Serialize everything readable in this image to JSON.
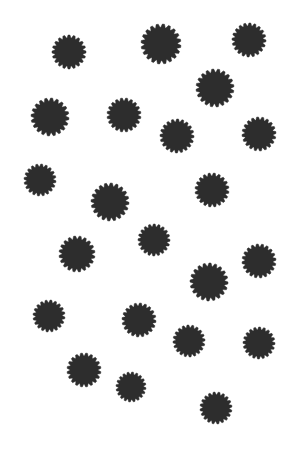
{
  "canvas": {
    "width": 304,
    "height": 473,
    "background_color": "#ffffff",
    "title": "Starburst Scatter"
  },
  "style": {
    "shape_fill_color": "#2d2d2d",
    "shape_kind": "starburst",
    "spike_count": 20,
    "inner_radius_ratio": 0.8,
    "spike_tip_rounding": 0.06
  },
  "chart_data": {
    "type": "scatter",
    "title": "",
    "subtitle": "",
    "xlabel": "",
    "ylabel": "",
    "grid": false,
    "legend": null,
    "axis_visible": false,
    "xlim": [
      0,
      304
    ],
    "ylim": [
      0,
      473
    ],
    "marker": "starburst",
    "marker_color": "#2d2d2d",
    "point_count": 22,
    "series": [
      {
        "name": "starbursts",
        "color": "#2d2d2d",
        "points": [
          {
            "id": "s1",
            "x": 69,
            "y": 52,
            "r": 17,
            "rotation": 0
          },
          {
            "id": "s2",
            "x": 161,
            "y": 44,
            "r": 20,
            "rotation": 7
          },
          {
            "id": "s3",
            "x": 249,
            "y": 40,
            "r": 17,
            "rotation": 3
          },
          {
            "id": "s4",
            "x": 215,
            "y": 88,
            "r": 19,
            "rotation": 11
          },
          {
            "id": "s5",
            "x": 50,
            "y": 117,
            "r": 19,
            "rotation": 5
          },
          {
            "id": "s6",
            "x": 124,
            "y": 115,
            "r": 17,
            "rotation": 9
          },
          {
            "id": "s7",
            "x": 177,
            "y": 136,
            "r": 17,
            "rotation": 2
          },
          {
            "id": "s8",
            "x": 259,
            "y": 134,
            "r": 17,
            "rotation": 13
          },
          {
            "id": "s9",
            "x": 40,
            "y": 180,
            "r": 16,
            "rotation": 6
          },
          {
            "id": "s10",
            "x": 110,
            "y": 202,
            "r": 19,
            "rotation": 4
          },
          {
            "id": "s11",
            "x": 212,
            "y": 190,
            "r": 17,
            "rotation": 8
          },
          {
            "id": "s12",
            "x": 154,
            "y": 240,
            "r": 16,
            "rotation": 1
          },
          {
            "id": "s13",
            "x": 77,
            "y": 254,
            "r": 18,
            "rotation": 10
          },
          {
            "id": "s14",
            "x": 259,
            "y": 261,
            "r": 17,
            "rotation": 12
          },
          {
            "id": "s15",
            "x": 209,
            "y": 282,
            "r": 19,
            "rotation": 3
          },
          {
            "id": "s16",
            "x": 49,
            "y": 316,
            "r": 16,
            "rotation": 7
          },
          {
            "id": "s17",
            "x": 139,
            "y": 320,
            "r": 17,
            "rotation": 5
          },
          {
            "id": "s18",
            "x": 189,
            "y": 341,
            "r": 16,
            "rotation": 14
          },
          {
            "id": "s19",
            "x": 259,
            "y": 343,
            "r": 16,
            "rotation": 2
          },
          {
            "id": "s20",
            "x": 84,
            "y": 370,
            "r": 17,
            "rotation": 9
          },
          {
            "id": "s21",
            "x": 131,
            "y": 387,
            "r": 15,
            "rotation": 6
          },
          {
            "id": "s22",
            "x": 216,
            "y": 408,
            "r": 16,
            "rotation": 11
          }
        ]
      }
    ]
  }
}
